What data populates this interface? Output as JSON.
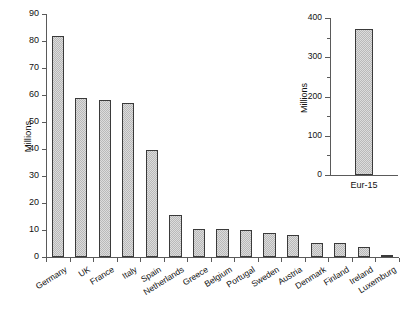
{
  "chart_data": [
    {
      "id": "main",
      "type": "bar",
      "title": "",
      "xlabel": "",
      "ylabel": "Millions",
      "ylim": [
        0,
        90
      ],
      "yticks": [
        0,
        10,
        20,
        30,
        40,
        50,
        60,
        70,
        80,
        90
      ],
      "ytick_labels": [
        "0",
        "10",
        "20",
        "30",
        "40",
        "50",
        "60",
        "70",
        "80",
        "90"
      ],
      "grid": false,
      "legend": false,
      "categories": [
        "Germany",
        "UK",
        "France",
        "Italy",
        "Spain",
        "Netherlands",
        "Greece",
        "Belgium",
        "Portugal",
        "Sweden",
        "Austria",
        "Denmark",
        "Finland",
        "Ireland",
        "Luxemburg"
      ],
      "values": [
        82,
        59,
        58,
        57,
        39.5,
        15.5,
        10.5,
        10.2,
        10.0,
        8.9,
        8.1,
        5.3,
        5.2,
        3.7,
        0.4
      ],
      "bar_fill": "#dcdcdc",
      "bar_edge": "#3a3a3a",
      "axis_color": "#5a5a5a"
    },
    {
      "id": "inset",
      "type": "bar",
      "title": "",
      "xlabel": "",
      "ylabel": "Millions",
      "ylim": [
        0,
        400
      ],
      "yticks": [
        0,
        100,
        200,
        300,
        400
      ],
      "ytick_labels": [
        "0",
        "100",
        "200",
        "300",
        "400"
      ],
      "yminorticks": [
        50,
        150,
        250,
        350
      ],
      "grid": false,
      "legend": false,
      "categories": [
        "Eur-15"
      ],
      "values": [
        373
      ],
      "bar_fill": "#dcdcdc",
      "bar_edge": "#3a3a3a",
      "axis_color": "#5a5a5a"
    }
  ]
}
